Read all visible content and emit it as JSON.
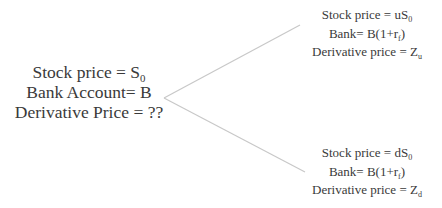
{
  "root": {
    "lines": [
      {
        "text": "Stock price = S",
        "sub": "0",
        "suffix": ""
      },
      {
        "text": "Bank Account= B",
        "sub": "",
        "suffix": ""
      },
      {
        "text": "Derivative Price = ??",
        "sub": "",
        "suffix": ""
      }
    ]
  },
  "up": {
    "lines": [
      {
        "text": "Stock price = uS",
        "sub": "0",
        "suffix": ""
      },
      {
        "text": "Bank= B(1+r",
        "sub": "f",
        "suffix": ")"
      },
      {
        "text": "Derivative price = Z",
        "sub": "u",
        "suffix": ""
      }
    ]
  },
  "down": {
    "lines": [
      {
        "text": "Stock price = dS",
        "sub": "0",
        "suffix": ""
      },
      {
        "text": "Bank= B(1+r",
        "sub": "f",
        "suffix": ")"
      },
      {
        "text": "Derivative price = Z",
        "sub": "d",
        "suffix": ""
      }
    ]
  },
  "edges": {
    "color": "#c8c8c8",
    "apex": [
      164,
      98
    ],
    "up_end": [
      300,
      25
    ],
    "down_end": [
      305,
      172
    ]
  }
}
